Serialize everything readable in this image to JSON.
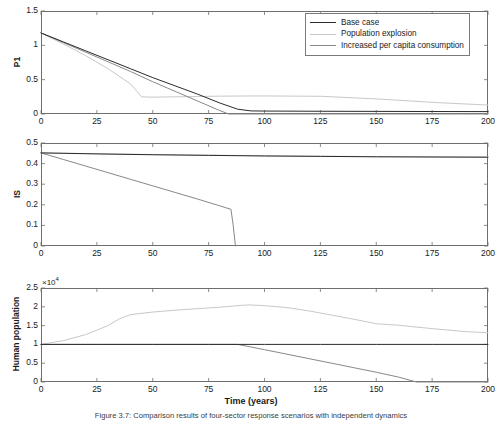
{
  "figure": {
    "caption": "Figure 3.7: Comparison results of four-sector response scenarios with independent dynamics",
    "xaxis_title": "Time (years)",
    "colors": {
      "base_case": "#2b2b2b",
      "population_explosion": "#c8c8c8",
      "increased_consumption": "#888888",
      "axis": "#6e6e6e",
      "text": "#1a1a1a"
    }
  },
  "legend": {
    "position": "top-right-panel-1",
    "entries": [
      {
        "label": "Base case",
        "color": "#2b2b2b"
      },
      {
        "label": "Population explosion",
        "color": "#c8c8c8"
      },
      {
        "label": "Increased per capita consumption",
        "color": "#888888"
      }
    ]
  },
  "chart_data": [
    {
      "type": "line",
      "panel": 1,
      "title": "",
      "xlabel": "",
      "ylabel": "P1",
      "xlim": [
        0,
        200
      ],
      "ylim": [
        0,
        1.5
      ],
      "xticks": [
        0,
        25,
        50,
        75,
        100,
        125,
        150,
        175,
        200
      ],
      "yticks": [
        0,
        0.5,
        1,
        1.5
      ],
      "ytick_labels": [
        "0",
        "0.5",
        "1",
        "1.5"
      ],
      "grid": false,
      "series": [
        {
          "name": "Base case",
          "color": "#2b2b2b",
          "x": [
            0,
            10,
            20,
            30,
            40,
            50,
            60,
            70,
            80,
            88,
            94,
            100,
            125,
            150,
            175,
            200
          ],
          "y": [
            1.18,
            1.05,
            0.92,
            0.79,
            0.66,
            0.53,
            0.41,
            0.29,
            0.16,
            0.07,
            0.045,
            0.043,
            0.04,
            0.038,
            0.036,
            0.035
          ]
        },
        {
          "name": "Population explosion",
          "color": "#c8c8c8",
          "x": [
            0,
            10,
            20,
            30,
            40,
            45,
            50,
            60,
            70,
            80,
            90,
            100,
            125,
            150,
            175,
            200
          ],
          "y": [
            1.18,
            1.02,
            0.85,
            0.66,
            0.44,
            0.25,
            0.245,
            0.25,
            0.255,
            0.26,
            0.262,
            0.263,
            0.258,
            0.22,
            0.17,
            0.13
          ]
        },
        {
          "name": "Increased per capita consumption",
          "color": "#888888",
          "x": [
            0,
            10,
            20,
            30,
            40,
            50,
            60,
            70,
            80,
            84,
            90,
            100,
            125,
            150,
            175,
            200
          ],
          "y": [
            1.18,
            1.04,
            0.9,
            0.76,
            0.62,
            0.47,
            0.33,
            0.19,
            0.05,
            0.0,
            0.0,
            0.0,
            0.0,
            0.0,
            0.0,
            0.0
          ]
        }
      ]
    },
    {
      "type": "line",
      "panel": 2,
      "title": "",
      "xlabel": "",
      "ylabel": "IS",
      "xlim": [
        0,
        200
      ],
      "ylim": [
        0,
        0.5
      ],
      "xticks": [
        0,
        25,
        50,
        75,
        100,
        125,
        150,
        175,
        200
      ],
      "yticks": [
        0,
        0.1,
        0.2,
        0.3,
        0.4,
        0.5
      ],
      "ytick_labels": [
        "0",
        "0.1",
        "0.2",
        "0.3",
        "0.4",
        "0.5"
      ],
      "grid": false,
      "series": [
        {
          "name": "Base case",
          "color": "#2b2b2b",
          "x": [
            0,
            25,
            50,
            75,
            100,
            125,
            150,
            175,
            200
          ],
          "y": [
            0.452,
            0.447,
            0.443,
            0.44,
            0.437,
            0.435,
            0.433,
            0.432,
            0.431
          ]
        },
        {
          "name": "Population explosion",
          "color": "#c8c8c8",
          "x": [
            0,
            25,
            50,
            75,
            100,
            125,
            150,
            175,
            200
          ],
          "y": [
            0.452,
            0.448,
            0.444,
            0.441,
            0.438,
            0.436,
            0.434,
            0.433,
            0.432
          ]
        },
        {
          "name": "Increased per capita consumption",
          "color": "#888888",
          "x": [
            0,
            10,
            20,
            30,
            40,
            50,
            60,
            70,
            80,
            85,
            86,
            87
          ],
          "y": [
            0.452,
            0.42,
            0.388,
            0.356,
            0.324,
            0.292,
            0.26,
            0.228,
            0.195,
            0.178,
            0.1,
            0.0
          ]
        }
      ]
    },
    {
      "type": "line",
      "panel": 3,
      "title": "",
      "xlabel": "Time (years)",
      "ylabel": "Human population",
      "y_multiplier": "×10",
      "y_multiplier_exp": "4",
      "xlim": [
        0,
        200
      ],
      "ylim": [
        0,
        25000
      ],
      "xticks": [
        0,
        25,
        50,
        75,
        100,
        125,
        150,
        175,
        200
      ],
      "yticks": [
        0,
        5000,
        10000,
        15000,
        20000,
        25000
      ],
      "ytick_labels": [
        "0",
        "0.5",
        "1",
        "1.5",
        "2",
        "2.5"
      ],
      "grid": false,
      "series": [
        {
          "name": "Base case",
          "color": "#2b2b2b",
          "x": [
            0,
            25,
            50,
            75,
            100,
            125,
            150,
            175,
            200
          ],
          "y": [
            10000,
            10000,
            10000,
            10000,
            10000,
            10000,
            10000,
            10000,
            10000
          ]
        },
        {
          "name": "Population explosion",
          "color": "#c8c8c8",
          "x": [
            0,
            10,
            20,
            30,
            35,
            40,
            50,
            60,
            70,
            80,
            90,
            93,
            100,
            110,
            120,
            130,
            140,
            150,
            160,
            175,
            190,
            200
          ],
          "y": [
            10000,
            11000,
            12600,
            15000,
            16800,
            17900,
            18600,
            19100,
            19500,
            19900,
            20400,
            20500,
            20300,
            19800,
            18900,
            17800,
            16700,
            15500,
            15100,
            14200,
            13400,
            13100
          ]
        },
        {
          "name": "Increased per capita consumption",
          "color": "#888888",
          "x": [
            0,
            25,
            50,
            75,
            88,
            100,
            110,
            120,
            130,
            140,
            150,
            160,
            168,
            175,
            200
          ],
          "y": [
            10000,
            10000,
            10000,
            10000,
            10000,
            8600,
            7400,
            6200,
            5000,
            3800,
            2600,
            1300,
            0,
            0,
            0
          ]
        }
      ]
    }
  ]
}
